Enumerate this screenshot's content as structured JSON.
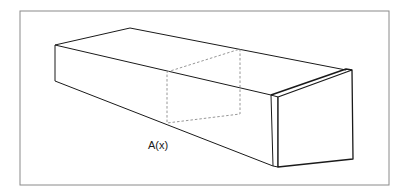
{
  "diagram": {
    "type": "3d-solid-cross-section",
    "label": "A(x)",
    "colors": {
      "frame": "#8a8a8a",
      "edges": "#1a1a1a",
      "dashed": "#8a8a8a",
      "background": "#ffffff"
    },
    "frame": {
      "x": 20,
      "y": 11,
      "width": 369,
      "height": 174
    },
    "solid": {
      "front_left_edge": [
        [
          55,
          45
        ],
        [
          55,
          81
        ]
      ],
      "top_back_edge": [
        [
          55,
          45
        ],
        [
          130,
          28
        ]
      ],
      "top_far_edge": [
        [
          130,
          28
        ],
        [
          346,
          70
        ]
      ],
      "top_near_edge": [
        [
          55,
          45
        ],
        [
          271,
          95
        ]
      ],
      "bottom_near_edge": [
        [
          55,
          81
        ],
        [
          273,
          167
        ]
      ],
      "end_strip": [
        [
          271,
          95
        ],
        [
          278,
          97
        ],
        [
          278,
          167
        ],
        [
          273,
          166
        ]
      ],
      "end_face": [
        [
          278,
          97
        ],
        [
          352,
          70
        ],
        [
          353,
          159
        ],
        [
          278,
          167
        ]
      ]
    },
    "cross_section": [
      [
        167,
        72
      ],
      [
        240,
        49
      ],
      [
        240,
        114
      ],
      [
        167,
        123
      ]
    ],
    "label_position": {
      "x": 148,
      "y": 149
    }
  }
}
